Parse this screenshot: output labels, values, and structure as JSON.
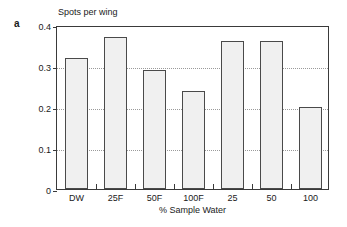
{
  "panel": {
    "label": "a"
  },
  "chart_data": {
    "type": "bar",
    "title": "Spots per wing",
    "xlabel": "% Sample Water",
    "ylabel": "Spots per wing",
    "categories": [
      "DW",
      "25F",
      "50F",
      "100F",
      "25",
      "50",
      "100"
    ],
    "values": [
      0.32,
      0.37,
      0.29,
      0.24,
      0.36,
      0.36,
      0.2
    ],
    "ylim": [
      0,
      0.4
    ],
    "yticks": [
      0,
      0.1,
      0.2,
      0.3,
      0.4
    ],
    "ytick_labels": [
      "0",
      "0.1",
      "0.2",
      "0.3",
      "0.4"
    ],
    "gridlines": [
      0.1,
      0.2,
      0.3
    ],
    "grid": true,
    "legend": false,
    "bar_fill_color": "#f0f0f0",
    "bar_edge_color": "#4a4a4a",
    "axis_color": "#3a3a3a",
    "gridline_color": "#9a9a9a"
  }
}
